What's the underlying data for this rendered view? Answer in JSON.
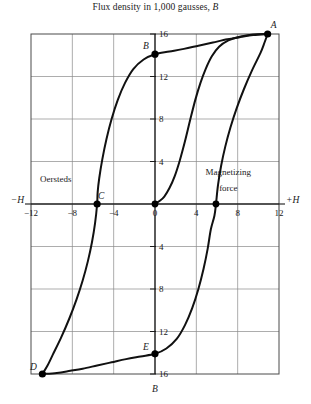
{
  "figure": {
    "title": "Flux density in 1,000 gausses,",
    "title_italic_symbol": "B",
    "axis_labels": {
      "left": "−H",
      "right": "+H",
      "bottom": "B",
      "top_symbol": "B"
    },
    "annotations": [
      {
        "name": "oersteds",
        "text": "Oersteds",
        "x": -9.6,
        "y": 2.1
      },
      {
        "name": "magnetizing-force-line1",
        "text": "Magnetizing",
        "x": 7.1,
        "y": 2.7
      },
      {
        "name": "magnetizing-force-line2",
        "text": "force",
        "x": 7.1,
        "y": 1.2
      }
    ],
    "colors": {
      "curve": "#111111",
      "grid": "#8a8a8a",
      "frame": "#4a4a4a",
      "axis": "#1a1a1a",
      "marker": "#000000",
      "background": "#ffffff"
    }
  },
  "chart_data": {
    "type": "line",
    "title": "Flux density in 1,000 gausses, B",
    "xlabel": "Magnetizing force (Oersteds), H",
    "ylabel": "Flux density in 1,000 gausses, B",
    "xlim": [
      -12,
      12
    ],
    "ylim": [
      -16,
      16
    ],
    "grid": true,
    "legend": "none",
    "x_ticks": [
      -12,
      -8,
      -4,
      0,
      4,
      8,
      12
    ],
    "x_tick_labels": [
      "−12",
      "−8",
      "−4",
      "0",
      "4",
      "8",
      "12"
    ],
    "y_ticks_upper": [
      4,
      8,
      12,
      16
    ],
    "y_tick_labels_upper": [
      "4",
      "8",
      "12",
      "16"
    ],
    "y_ticks_lower": [
      -4,
      -8,
      -12,
      -16
    ],
    "y_tick_labels_lower": [
      "4",
      "8",
      "12",
      "16"
    ],
    "labeled_points": [
      {
        "label": "A",
        "x": 10.9,
        "y": 16.0,
        "label_dx": 6,
        "label_dy": -6
      },
      {
        "label": "B",
        "x": 0.0,
        "y": 14.1,
        "label_dx": -9,
        "label_dy": -5
      },
      {
        "label": "C",
        "x": -5.6,
        "y": 0.0,
        "label_dx": 4,
        "label_dy": -5
      },
      {
        "label": "D",
        "x": -10.9,
        "y": -16.0,
        "label_dx": -9,
        "label_dy": -4
      },
      {
        "label": "E",
        "x": 0.0,
        "y": -14.1,
        "label_dx": -9,
        "label_dy": -4
      }
    ],
    "unlabeled_points": [
      {
        "x": 0.0,
        "y": 0.0
      },
      {
        "x": 5.9,
        "y": 0.0
      }
    ],
    "series": [
      {
        "name": "initial-magnetization-curve",
        "points": [
          [
            0.0,
            0.0
          ],
          [
            0.4,
            0.25
          ],
          [
            0.9,
            0.7
          ],
          [
            1.4,
            1.5
          ],
          [
            1.9,
            2.6
          ],
          [
            2.4,
            4.1
          ],
          [
            2.9,
            5.9
          ],
          [
            3.4,
            7.9
          ],
          [
            3.9,
            9.8
          ],
          [
            4.4,
            11.4
          ],
          [
            4.9,
            12.7
          ],
          [
            5.5,
            13.9
          ],
          [
            6.2,
            14.8
          ],
          [
            7.1,
            15.4
          ],
          [
            8.2,
            15.75
          ],
          [
            9.5,
            15.95
          ],
          [
            10.9,
            16.0
          ]
        ]
      },
      {
        "name": "descending-branch",
        "points": [
          [
            10.9,
            16.0
          ],
          [
            9.5,
            15.9
          ],
          [
            8.2,
            15.7
          ],
          [
            7.0,
            15.5
          ],
          [
            5.6,
            15.2
          ],
          [
            4.2,
            14.9
          ],
          [
            2.8,
            14.6
          ],
          [
            1.4,
            14.35
          ],
          [
            0.0,
            14.1
          ],
          [
            -1.1,
            13.6
          ],
          [
            -2.1,
            12.7
          ],
          [
            -2.9,
            11.4
          ],
          [
            -3.6,
            9.8
          ],
          [
            -4.2,
            8.0
          ],
          [
            -4.7,
            6.1
          ],
          [
            -5.1,
            4.2
          ],
          [
            -5.4,
            2.4
          ],
          [
            -5.55,
            1.1
          ],
          [
            -5.6,
            0.0
          ],
          [
            -5.8,
            -1.8
          ],
          [
            -6.1,
            -3.6
          ],
          [
            -6.5,
            -5.4
          ],
          [
            -7.0,
            -7.2
          ],
          [
            -7.6,
            -9.0
          ],
          [
            -8.3,
            -10.8
          ],
          [
            -9.1,
            -12.6
          ],
          [
            -9.9,
            -14.2
          ],
          [
            -10.4,
            -15.2
          ],
          [
            -10.9,
            -16.0
          ]
        ]
      },
      {
        "name": "ascending-branch",
        "points": [
          [
            -10.9,
            -16.0
          ],
          [
            -9.5,
            -15.9
          ],
          [
            -8.2,
            -15.7
          ],
          [
            -7.0,
            -15.5
          ],
          [
            -5.6,
            -15.2
          ],
          [
            -4.2,
            -14.9
          ],
          [
            -2.8,
            -14.6
          ],
          [
            -1.4,
            -14.35
          ],
          [
            0.0,
            -14.1
          ],
          [
            1.1,
            -13.6
          ],
          [
            2.1,
            -12.7
          ],
          [
            2.9,
            -11.4
          ],
          [
            3.6,
            -9.8
          ],
          [
            4.2,
            -8.0
          ],
          [
            4.7,
            -6.1
          ],
          [
            5.1,
            -4.2
          ],
          [
            5.4,
            -2.4
          ],
          [
            5.75,
            -1.1
          ],
          [
            5.9,
            0.0
          ],
          [
            6.1,
            1.8
          ],
          [
            6.4,
            3.6
          ],
          [
            6.8,
            5.4
          ],
          [
            7.3,
            7.2
          ],
          [
            7.9,
            9.0
          ],
          [
            8.6,
            10.8
          ],
          [
            9.4,
            12.6
          ],
          [
            10.2,
            14.2
          ],
          [
            10.6,
            15.2
          ],
          [
            10.9,
            16.0
          ]
        ]
      }
    ]
  }
}
